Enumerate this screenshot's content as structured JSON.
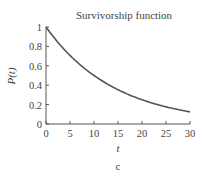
{
  "chart_data": {
    "type": "line",
    "title": "Survivorship function",
    "xlabel": "t",
    "ylabel": "P(t)",
    "caption": "c",
    "xlim": [
      0,
      30
    ],
    "ylim": [
      0,
      1
    ],
    "xticks": [
      0,
      5,
      10,
      15,
      20,
      25,
      30
    ],
    "xtick_labels": [
      "0",
      "5",
      "10",
      "15",
      "20",
      "25",
      "30"
    ],
    "yticks": [
      0,
      0.2,
      0.4,
      0.6,
      0.8,
      1
    ],
    "ytick_labels": [
      "0",
      "0.2",
      "0.4",
      "0.6",
      "0.8",
      "1"
    ],
    "grid": false,
    "series": [
      {
        "name": "P(t)",
        "x": [
          0,
          2.5,
          5,
          7.5,
          10,
          12.5,
          15,
          17.5,
          20,
          22.5,
          25,
          27.5,
          30
        ],
        "y": [
          1.0,
          0.841,
          0.707,
          0.595,
          0.5,
          0.42,
          0.354,
          0.297,
          0.25,
          0.21,
          0.177,
          0.149,
          0.125
        ]
      }
    ],
    "line_color": "#555555"
  }
}
